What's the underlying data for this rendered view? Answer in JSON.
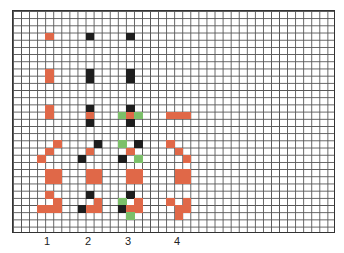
{
  "grid": {
    "cols": 40,
    "rows": 31
  },
  "colors": {
    "orange": "#e06848",
    "black": "#1e1e1e",
    "green": "#7cc06a"
  },
  "labels": [
    {
      "text": "1",
      "x": 47
    },
    {
      "text": "2",
      "x": 88
    },
    {
      "text": "3",
      "x": 128
    },
    {
      "text": "4",
      "x": 177
    }
  ],
  "cells": [
    {
      "c": 4,
      "r": 3,
      "k": "orange"
    },
    {
      "c": 4,
      "r": 8,
      "k": "orange"
    },
    {
      "c": 4,
      "r": 9,
      "k": "orange"
    },
    {
      "c": 4,
      "r": 13,
      "k": "orange"
    },
    {
      "c": 4,
      "r": 14,
      "k": "orange"
    },
    {
      "c": 5,
      "r": 18,
      "k": "orange"
    },
    {
      "c": 4,
      "r": 19,
      "k": "orange"
    },
    {
      "c": 3,
      "r": 20,
      "k": "orange"
    },
    {
      "c": 4,
      "r": 22,
      "k": "orange"
    },
    {
      "c": 5,
      "r": 22,
      "k": "orange"
    },
    {
      "c": 4,
      "r": 23,
      "k": "orange"
    },
    {
      "c": 5,
      "r": 23,
      "k": "orange"
    },
    {
      "c": 4,
      "r": 25,
      "k": "orange"
    },
    {
      "c": 5,
      "r": 26,
      "k": "orange"
    },
    {
      "c": 3,
      "r": 27,
      "k": "orange"
    },
    {
      "c": 4,
      "r": 27,
      "k": "orange"
    },
    {
      "c": 5,
      "r": 27,
      "k": "orange"
    },
    {
      "c": 9,
      "r": 3,
      "k": "black"
    },
    {
      "c": 9,
      "r": 8,
      "k": "black"
    },
    {
      "c": 9,
      "r": 9,
      "k": "black"
    },
    {
      "c": 9,
      "r": 13,
      "k": "black"
    },
    {
      "c": 9,
      "r": 14,
      "k": "orange"
    },
    {
      "c": 9,
      "r": 15,
      "k": "black"
    },
    {
      "c": 10,
      "r": 18,
      "k": "black"
    },
    {
      "c": 9,
      "r": 19,
      "k": "orange"
    },
    {
      "c": 8,
      "r": 20,
      "k": "black"
    },
    {
      "c": 9,
      "r": 22,
      "k": "orange"
    },
    {
      "c": 10,
      "r": 22,
      "k": "orange"
    },
    {
      "c": 9,
      "r": 23,
      "k": "orange"
    },
    {
      "c": 10,
      "r": 23,
      "k": "orange"
    },
    {
      "c": 9,
      "r": 25,
      "k": "black"
    },
    {
      "c": 10,
      "r": 26,
      "k": "orange"
    },
    {
      "c": 8,
      "r": 27,
      "k": "black"
    },
    {
      "c": 9,
      "r": 27,
      "k": "orange"
    },
    {
      "c": 10,
      "r": 27,
      "k": "orange"
    },
    {
      "c": 14,
      "r": 3,
      "k": "black"
    },
    {
      "c": 14,
      "r": 8,
      "k": "black"
    },
    {
      "c": 14,
      "r": 9,
      "k": "black"
    },
    {
      "c": 14,
      "r": 13,
      "k": "black"
    },
    {
      "c": 13,
      "r": 14,
      "k": "green"
    },
    {
      "c": 14,
      "r": 14,
      "k": "orange"
    },
    {
      "c": 15,
      "r": 14,
      "k": "green"
    },
    {
      "c": 14,
      "r": 15,
      "k": "black"
    },
    {
      "c": 13,
      "r": 18,
      "k": "green"
    },
    {
      "c": 15,
      "r": 18,
      "k": "black"
    },
    {
      "c": 14,
      "r": 19,
      "k": "orange"
    },
    {
      "c": 13,
      "r": 20,
      "k": "black"
    },
    {
      "c": 15,
      "r": 20,
      "k": "green"
    },
    {
      "c": 14,
      "r": 22,
      "k": "orange"
    },
    {
      "c": 15,
      "r": 22,
      "k": "orange"
    },
    {
      "c": 14,
      "r": 23,
      "k": "orange"
    },
    {
      "c": 15,
      "r": 23,
      "k": "orange"
    },
    {
      "c": 14,
      "r": 25,
      "k": "black"
    },
    {
      "c": 13,
      "r": 26,
      "k": "green"
    },
    {
      "c": 15,
      "r": 26,
      "k": "orange"
    },
    {
      "c": 13,
      "r": 27,
      "k": "black"
    },
    {
      "c": 14,
      "r": 27,
      "k": "orange"
    },
    {
      "c": 15,
      "r": 27,
      "k": "orange"
    },
    {
      "c": 14,
      "r": 28,
      "k": "green"
    },
    {
      "c": 19,
      "r": 14,
      "k": "orange"
    },
    {
      "c": 20,
      "r": 14,
      "k": "orange"
    },
    {
      "c": 21,
      "r": 14,
      "k": "orange"
    },
    {
      "c": 19,
      "r": 18,
      "k": "orange"
    },
    {
      "c": 20,
      "r": 19,
      "k": "orange"
    },
    {
      "c": 21,
      "r": 20,
      "k": "orange"
    },
    {
      "c": 20,
      "r": 22,
      "k": "orange"
    },
    {
      "c": 21,
      "r": 22,
      "k": "orange"
    },
    {
      "c": 20,
      "r": 23,
      "k": "orange"
    },
    {
      "c": 21,
      "r": 23,
      "k": "orange"
    },
    {
      "c": 19,
      "r": 26,
      "k": "orange"
    },
    {
      "c": 21,
      "r": 26,
      "k": "orange"
    },
    {
      "c": 20,
      "r": 27,
      "k": "orange"
    },
    {
      "c": 21,
      "r": 27,
      "k": "orange"
    },
    {
      "c": 20,
      "r": 28,
      "k": "orange"
    }
  ]
}
